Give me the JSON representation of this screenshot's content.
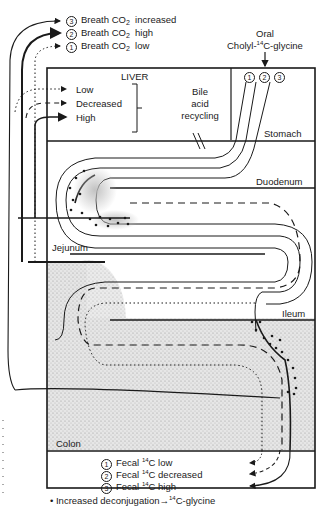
{
  "breath": {
    "items": [
      {
        "num": "3",
        "prefix": "Breath CO",
        "sub": "2",
        "state": "increased"
      },
      {
        "num": "2",
        "prefix": "Breath CO",
        "sub": "2",
        "state": "high"
      },
      {
        "num": "1",
        "prefix": "Breath CO",
        "sub": "2",
        "state": "low"
      }
    ]
  },
  "oral": {
    "line1": "Oral",
    "prefix": "Cholyl-",
    "sup": "14",
    "suffix": "C-glycine",
    "markers": [
      "1",
      "2",
      "3"
    ]
  },
  "liver": {
    "title": "LIVER",
    "levels": [
      "Low",
      "Decreased",
      "High"
    ]
  },
  "recycling": {
    "lines": [
      "Bile",
      "acid",
      "recycling"
    ]
  },
  "organs": {
    "stomach": "Stomach",
    "duodenum": "Duodenum",
    "jejunum": "Jejunum",
    "ileum": "Ileum",
    "colon": "Colon"
  },
  "fecal": {
    "items": [
      {
        "num": "1",
        "prefix": "Fecal ",
        "sup": "14",
        "suffix": "C low"
      },
      {
        "num": "2",
        "prefix": "Fecal ",
        "sup": "14",
        "suffix": "C decreased"
      },
      {
        "num": "3",
        "prefix": "Fecal ",
        "sup": "14",
        "suffix": "C high"
      }
    ]
  },
  "footnote": {
    "bullet": "•",
    "text": "Increased deconjugation",
    "arrow": "→",
    "sup": "14",
    "suffix": "C-glycine"
  },
  "colors": {
    "ink": "#1a1a1a",
    "stipple": "#cfcfcf",
    "background": "#ffffff"
  }
}
